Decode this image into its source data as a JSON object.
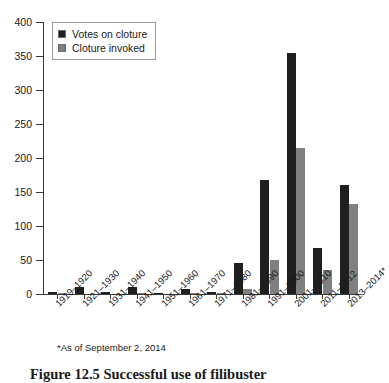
{
  "chart_data": {
    "type": "bar",
    "title": "",
    "xlabel": "",
    "ylabel": "",
    "ylim": [
      0,
      400
    ],
    "ytick_values": [
      0,
      50,
      100,
      150,
      200,
      250,
      300,
      350,
      400
    ],
    "ytick_labels": [
      "0",
      "50",
      "100",
      "150",
      "200",
      "250",
      "300",
      "350",
      "400"
    ],
    "grid": false,
    "legend_position": "upper-left-inside",
    "categories": [
      "1919–1920",
      "1921–1930",
      "1931–1940",
      "1941–1950",
      "1951–1960",
      "1961–1970",
      "1971–1980",
      "1981–1990",
      "1991–2000",
      "2001–2010",
      "2011–2012",
      "2013–2014*"
    ],
    "series": [
      {
        "name": "Votes on cloture",
        "color": "#1f1f1f",
        "values": [
          3,
          10,
          3,
          11,
          2,
          7,
          3,
          46,
          168,
          354,
          68,
          160
        ]
      },
      {
        "name": "Cloture invoked",
        "color": "#808080",
        "values": [
          1,
          0,
          0,
          1,
          0,
          2,
          1,
          7,
          50,
          215,
          36,
          133
        ]
      }
    ],
    "annotations": {
      "footnote": "*As of September 2, 2014"
    }
  },
  "legend": {
    "items": [
      {
        "label": "Votes on cloture",
        "color": "#1f1f1f"
      },
      {
        "label": "Cloture invoked",
        "color": "#808080"
      }
    ]
  },
  "caption": {
    "text": "Figure 12.5  Successful use of filibuster"
  }
}
